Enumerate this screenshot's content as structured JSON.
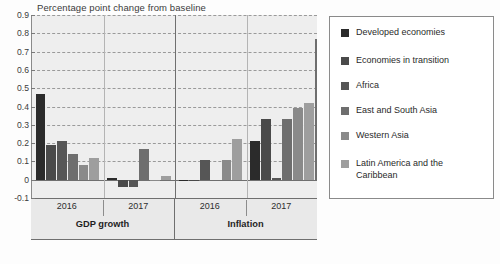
{
  "chart_data": {
    "type": "bar",
    "title": "Percentage point change from baseline",
    "xlabel": "",
    "ylabel": "",
    "ylim": [
      -0.1,
      0.9
    ],
    "ytick_step": 0.1,
    "yticks": [
      "0.9",
      "0.8",
      "0.7",
      "0.6",
      "0.5",
      "0.4",
      "0.3",
      "0.2",
      "0.1",
      "0",
      "-0.1"
    ],
    "grid": true,
    "legend_position": "right",
    "groups": [
      {
        "category": "GDP growth",
        "year": "2016"
      },
      {
        "category": "GDP growth",
        "year": "2017"
      },
      {
        "category": "Inflation",
        "year": "2016"
      },
      {
        "category": "Inflation",
        "year": "2017"
      }
    ],
    "categories": [
      "GDP growth 2016",
      "GDP growth 2017",
      "Inflation 2016",
      "Inflation 2017"
    ],
    "series": [
      {
        "name": "Developed economies",
        "color": "#2b2b2b",
        "values": [
          0.47,
          0.01,
          0.0,
          0.21
        ]
      },
      {
        "name": "Economies in transition",
        "color": "#4a4a4a",
        "values": [
          0.19,
          -0.04,
          0.0,
          0.33
        ]
      },
      {
        "name": "Africa",
        "color": "#565656",
        "values": [
          0.21,
          -0.04,
          0.11,
          0.01
        ]
      },
      {
        "name": "East and South Asia",
        "color": "#6e6e6e",
        "values": [
          0.14,
          0.17,
          0.0,
          0.33
        ]
      },
      {
        "name": "Western Asia",
        "color": "#8a8a8a",
        "values": [
          0.08,
          0.0,
          0.11,
          0.39
        ]
      },
      {
        "name": "Latin America and the Caribbean",
        "color": "#9e9e9e",
        "values": [
          0.12,
          0.02,
          0.22,
          0.42
        ]
      }
    ],
    "extra_bar": {
      "note": "tallest bar at far right of Inflation 2017",
      "value": 0.77,
      "color": "#6e6e6e"
    }
  },
  "legend": {
    "items": [
      {
        "label": "Developed economies",
        "color": "#2b2b2b"
      },
      {
        "label": "Economies in transition",
        "color": "#4a4a4a"
      },
      {
        "label": "Africa",
        "color": "#565656"
      },
      {
        "label": "East and South Asia",
        "color": "#6e6e6e"
      },
      {
        "label": "Western Asia",
        "color": "#8a8a8a"
      },
      {
        "label": "Latin America and the\nCaribbean",
        "color": "#9e9e9e"
      }
    ]
  },
  "axis": {
    "x_years": [
      "2016",
      "2017",
      "2016",
      "2017"
    ],
    "x_categories": [
      "GDP growth",
      "Inflation"
    ]
  }
}
